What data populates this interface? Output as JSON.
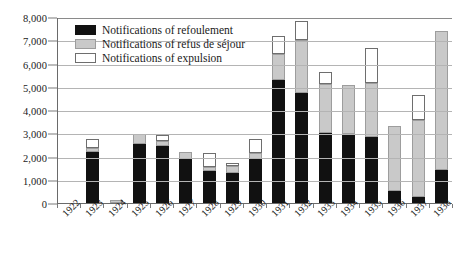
{
  "chart_data": {
    "type": "bar",
    "stacked": true,
    "title": "",
    "subtitle": "",
    "xlabel": "",
    "ylabel": "",
    "ylim": [
      0,
      8000
    ],
    "ytick_step": 1000,
    "ytick_labels": [
      "0",
      "1,000",
      "2,000",
      "3,000",
      "4,000",
      "5,000",
      "6,000",
      "7,000",
      "8,000"
    ],
    "grid": true,
    "legend_position": "inside-top-left",
    "categories": [
      "1922",
      "1923",
      "1924",
      "1925",
      "1926",
      "1927",
      "1928",
      "1929",
      "1930",
      "1931",
      "1932",
      "1933",
      "1934",
      "1935",
      "1936",
      "1937",
      "1938"
    ],
    "series": [
      {
        "name": "Notifications of refoulement",
        "color": "#111111",
        "values": [
          0,
          2200,
          0,
          2520,
          2450,
          1900,
          1380,
          1280,
          1880,
          5300,
          4750,
          3000,
          2950,
          2820,
          500,
          250,
          1400
        ]
      },
      {
        "name": "Notifications of refus de séjour",
        "color": "#c9c9c9",
        "values": [
          0,
          170,
          150,
          430,
          230,
          280,
          190,
          330,
          270,
          1100,
          2250,
          2100,
          2130,
          2360,
          2800,
          3300,
          6000
        ]
      },
      {
        "name": "Notifications of expulsion",
        "color": "#ffffff",
        "values": [
          0,
          380,
          0,
          0,
          250,
          0,
          580,
          110,
          620,
          800,
          850,
          520,
          0,
          1500,
          0,
          1100,
          0
        ]
      }
    ],
    "totals": [
      0,
      2750,
      150,
      2950,
      2930,
      2180,
      2150,
      1720,
      2770,
      7200,
      7850,
      5620,
      5080,
      6680,
      3300,
      4650,
      7400
    ]
  },
  "legend": {
    "items": [
      {
        "label": "Notifications of refoulement"
      },
      {
        "label": "Notifications of refus de séjour"
      },
      {
        "label": "Notifications of expulsion"
      }
    ]
  }
}
